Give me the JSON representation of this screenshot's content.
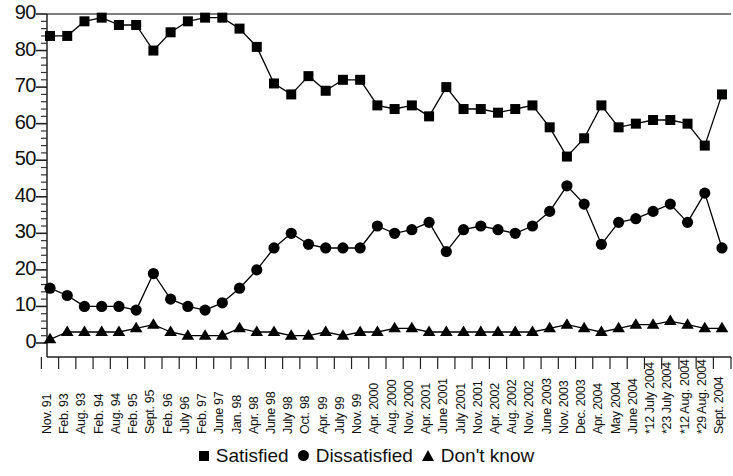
{
  "chart_data": {
    "type": "line",
    "title": "",
    "subtitle": "",
    "xlabel": "",
    "ylabel": "",
    "ylim": [
      0,
      90
    ],
    "yticks": [
      0,
      10,
      20,
      30,
      40,
      50,
      60,
      70,
      80,
      90
    ],
    "minor_tick_step": 2,
    "grid": false,
    "legend_position": "bottom-center",
    "categories": [
      "Nov. 91",
      "Feb. 93",
      "Aug. 93",
      "Feb. 94",
      "Aug. 94",
      "Feb. 95",
      "Sept. 95",
      "Feb. 96",
      "July 96",
      "Feb. 97",
      "June 97",
      "Jan. 98",
      "Apr. 98",
      "June 98",
      "July 98",
      "Oct. 98",
      "Apr. 99",
      "July 99",
      "Nov. 99",
      "Apr. 2000",
      "Aug. 2000",
      "Nov. 2000",
      "Apr. 2001",
      "June 2001",
      "July 2001",
      "Nov. 2001",
      "Apr. 2002",
      "Aug. 2002",
      "Nov. 2002",
      "June 2003",
      "Nov. 2003",
      "Dec. 2003",
      "Apr. 2004",
      "May 2004",
      "June 2004",
      "*12 July 2004",
      "*23 July 2004",
      "*12 Aug. 2004",
      "*29 Aug. 2004",
      "Sept. 2004"
    ],
    "series": [
      {
        "name": "Satisfied",
        "marker": "square",
        "color": "#000000",
        "values": [
          84,
          84,
          88,
          89,
          87,
          87,
          80,
          85,
          88,
          89,
          89,
          86,
          81,
          71,
          68,
          73,
          69,
          72,
          72,
          65,
          64,
          65,
          62,
          70,
          64,
          64,
          63,
          64,
          65,
          59,
          51,
          56,
          65,
          59,
          60,
          61,
          61,
          60,
          54,
          68
        ]
      },
      {
        "name": "Dissatisfied",
        "marker": "circle",
        "color": "#000000",
        "values": [
          15,
          13,
          10,
          10,
          10,
          9,
          19,
          12,
          10,
          9,
          11,
          15,
          20,
          26,
          30,
          27,
          26,
          26,
          26,
          32,
          30,
          31,
          33,
          25,
          31,
          32,
          31,
          30,
          32,
          36,
          43,
          38,
          27,
          33,
          34,
          36,
          38,
          33,
          41,
          26
        ]
      },
      {
        "name": "Don't know",
        "marker": "triangle",
        "color": "#000000",
        "values": [
          1,
          3,
          3,
          3,
          3,
          4,
          5,
          3,
          2,
          2,
          2,
          4,
          3,
          3,
          2,
          2,
          3,
          2,
          3,
          3,
          4,
          4,
          3,
          3,
          3,
          3,
          3,
          3,
          3,
          4,
          5,
          4,
          3,
          4,
          5,
          5,
          6,
          5,
          4,
          4
        ]
      }
    ]
  },
  "legend": {
    "items": [
      {
        "label": "Satisfied",
        "marker": "square"
      },
      {
        "label": "Dissatisfied",
        "marker": "circle"
      },
      {
        "label": "Don't know",
        "marker": "triangle"
      }
    ]
  }
}
